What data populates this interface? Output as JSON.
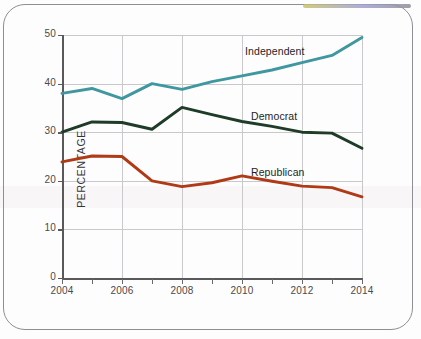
{
  "chart_data": {
    "type": "line",
    "title": "",
    "xlabel": "",
    "ylabel": "PERCENTAGE",
    "x": [
      2004,
      2005,
      2006,
      2007,
      2008,
      2009,
      2010,
      2011,
      2012,
      2013,
      2014
    ],
    "xtick_labels": [
      "2004",
      "2006",
      "2008",
      "2010",
      "2012",
      "2014"
    ],
    "xtick_values": [
      2004,
      2006,
      2008,
      2010,
      2012,
      2014
    ],
    "ytick_labels": [
      "0",
      "10",
      "20",
      "30",
      "40",
      "50"
    ],
    "ytick_values": [
      0,
      10,
      20,
      30,
      40,
      50
    ],
    "xlim": [
      2004,
      2014
    ],
    "ylim": [
      0,
      50
    ],
    "grid": true,
    "legend_position": "inline-annotation",
    "series": [
      {
        "name": "Independent",
        "color": "#3f97a0",
        "values": [
          38.0,
          39.0,
          36.9,
          40.0,
          38.8,
          40.4,
          41.6,
          42.8,
          44.3,
          45.8,
          49.5
        ],
        "label_x": 2010.1,
        "label_y": 46.6
      },
      {
        "name": "Democrat",
        "color": "#1e3c28",
        "values": [
          30.0,
          32.1,
          32.0,
          30.6,
          35.1,
          33.6,
          32.2,
          31.2,
          30.0,
          29.8,
          26.7
        ],
        "label_x": 2010.3,
        "label_y": 33.1
      },
      {
        "name": "Republican",
        "color": "#b03a16",
        "values": [
          23.9,
          25.1,
          25.0,
          20.0,
          18.8,
          19.6,
          21.0,
          19.9,
          18.9,
          18.6,
          16.7
        ],
        "label_x": 2010.3,
        "label_y": 21.6
      }
    ]
  },
  "axis": {
    "y_title": "PERCENTAGE"
  }
}
